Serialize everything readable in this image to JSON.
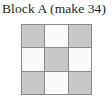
{
  "block": {
    "caption": "Block A (make 34)",
    "label": "Block A",
    "quantity_text": "(make 34)",
    "quantity": 34
  },
  "grid": {
    "rows": 3,
    "columns": 3,
    "gridline_color": "#8a8a8a",
    "shaded_color": "#c8c8c8",
    "light_color": "#fafafa",
    "cells": [
      {
        "row": 1,
        "col": 1,
        "fabric": "shaded",
        "color": "#c8c8c8"
      },
      {
        "row": 1,
        "col": 2,
        "fabric": "light",
        "color": "#fafafa"
      },
      {
        "row": 1,
        "col": 3,
        "fabric": "shaded",
        "color": "#c8c8c8"
      },
      {
        "row": 2,
        "col": 1,
        "fabric": "light",
        "color": "#fafafa"
      },
      {
        "row": 2,
        "col": 2,
        "fabric": "shaded",
        "color": "#c8c8c8"
      },
      {
        "row": 2,
        "col": 3,
        "fabric": "light",
        "color": "#fafafa"
      },
      {
        "row": 3,
        "col": 1,
        "fabric": "shaded",
        "color": "#c8c8c8"
      },
      {
        "row": 3,
        "col": 2,
        "fabric": "light",
        "color": "#fafafa"
      },
      {
        "row": 3,
        "col": 3,
        "fabric": "shaded",
        "color": "#c8c8c8"
      }
    ]
  },
  "page": {
    "background": "#ffffff",
    "text_color": "#231f20"
  }
}
